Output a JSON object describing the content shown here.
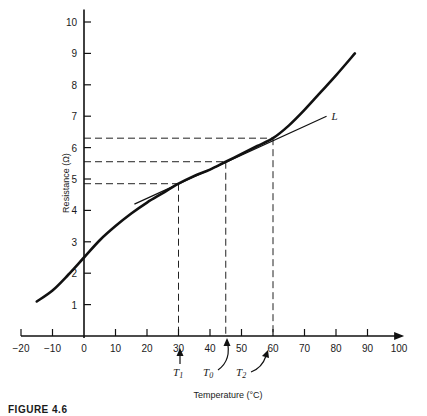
{
  "chart_data": {
    "type": "line",
    "title": "",
    "xlabel": "Temperature (°C)",
    "ylabel": "Resistance (Ω)",
    "xlim": [
      -20,
      100
    ],
    "ylim": [
      0,
      10
    ],
    "x_ticks": [
      -20,
      -10,
      0,
      10,
      20,
      30,
      40,
      50,
      60,
      70,
      80,
      90,
      100
    ],
    "y_ticks": [
      1,
      2,
      3,
      4,
      5,
      6,
      7,
      8,
      9,
      10
    ],
    "grid": false,
    "series": [
      {
        "name": "Resistance curve",
        "x": [
          -15,
          -10,
          -5,
          0,
          5,
          10,
          15,
          20,
          25,
          30,
          35,
          40,
          45,
          50,
          55,
          60,
          65,
          70,
          75,
          80,
          86
        ],
        "y": [
          1.1,
          1.45,
          1.95,
          2.5,
          3.05,
          3.5,
          3.9,
          4.25,
          4.55,
          4.85,
          5.1,
          5.3,
          5.55,
          5.8,
          6.05,
          6.3,
          6.7,
          7.2,
          7.75,
          8.3,
          9.0
        ]
      },
      {
        "name": "L",
        "style": "tangent line",
        "x": [
          16,
          77
        ],
        "y": [
          4.2,
          7.0
        ]
      }
    ],
    "reference_lines": [
      {
        "label": "T1",
        "x": 30,
        "y": 4.85
      },
      {
        "label": "T0",
        "x": 45,
        "y": 5.55
      },
      {
        "label": "T2",
        "x": 60,
        "y": 6.3
      }
    ],
    "annotations": [
      {
        "text": "L",
        "near": "end of tangent line"
      },
      {
        "text": "T1",
        "points_to": 30
      },
      {
        "text": "T0",
        "points_to": 45
      },
      {
        "text": "T2",
        "points_to": 60
      }
    ]
  },
  "caption": "FIGURE 4.6",
  "labels": {
    "xlabel": "Temperature (°C)",
    "ylabel": "Resistance (Ω)",
    "L": "L",
    "T1": "T",
    "T1_sub": "1",
    "T0": "T",
    "T0_sub": "0",
    "T2": "T",
    "T2_sub": "2"
  }
}
